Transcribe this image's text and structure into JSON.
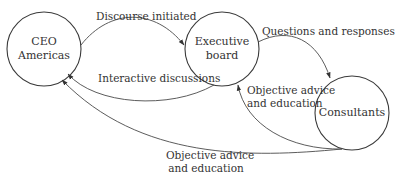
{
  "diagram": {
    "type": "flow",
    "nodes": [
      {
        "id": "ceo",
        "label_line1": "CEO",
        "label_line2": "Americas",
        "cx": 44,
        "cy": 49,
        "r": 37
      },
      {
        "id": "board",
        "label_line1": "Executive",
        "label_line2": "board",
        "cx": 222,
        "cy": 49,
        "r": 37
      },
      {
        "id": "consultants",
        "label_line1": "Consultants",
        "label_line2": "",
        "cx": 352,
        "cy": 113,
        "r": 37
      }
    ],
    "edges": [
      {
        "from": "ceo",
        "to": "board",
        "label": "Discourse initiated"
      },
      {
        "from": "board",
        "to": "consultants",
        "label": "Questions and responses"
      },
      {
        "from": "board",
        "to": "ceo",
        "label": "Interactive discussions"
      },
      {
        "from": "consultants",
        "to": "board",
        "label_line1": "Objective advice",
        "label_line2": "and education"
      },
      {
        "from": "consultants",
        "to": "ceo",
        "label_line1": "Objective advice",
        "label_line2": "and education"
      }
    ]
  }
}
